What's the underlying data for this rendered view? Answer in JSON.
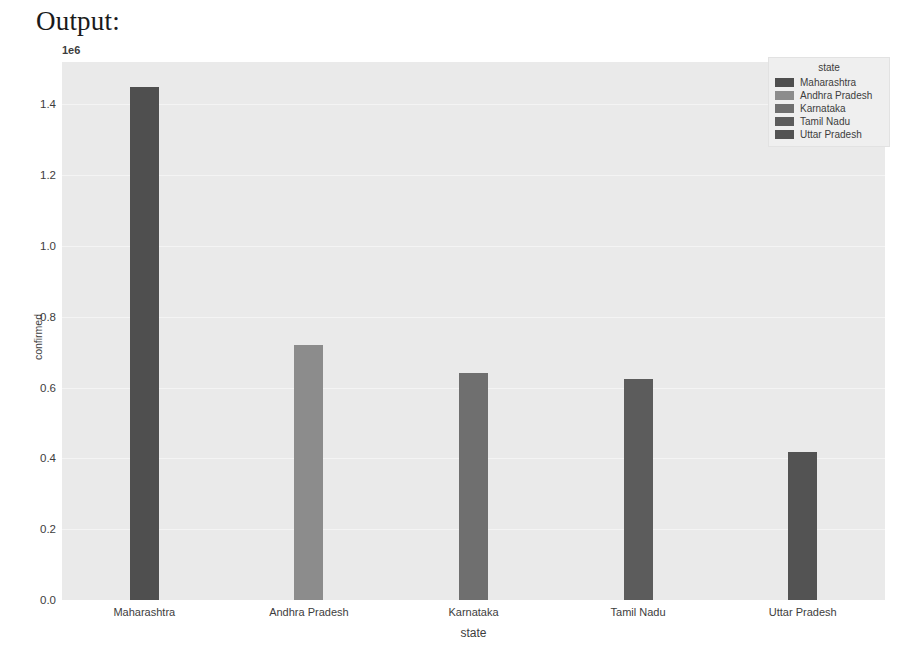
{
  "output_label": "Output:",
  "chart_data": {
    "type": "bar",
    "title": "",
    "xlabel": "state",
    "ylabel": "confirmed",
    "y_offset_text": "1e6",
    "y_offset_multiplier": 1000000,
    "categories": [
      "Maharashtra",
      "Andhra Pradesh",
      "Karnataka",
      "Tamil Nadu",
      "Uttar Pradesh"
    ],
    "values": [
      1450000,
      720000,
      640000,
      625000,
      418000
    ],
    "values_scaled": [
      1.45,
      0.72,
      0.64,
      0.625,
      0.418
    ],
    "bar_colors": [
      "#4f4f4f",
      "#8c8c8c",
      "#6f6f6f",
      "#5c5c5c",
      "#535353"
    ],
    "ylim": [
      0,
      1.52
    ],
    "yticks": [
      0.0,
      0.2,
      0.4,
      0.6,
      0.8,
      1.0,
      1.2,
      1.4
    ],
    "ytick_labels": [
      "0.0",
      "0.2",
      "0.4",
      "0.6",
      "0.8",
      "1.0",
      "1.2",
      "1.4"
    ],
    "grid": true,
    "grid_color": "#f4f4f4",
    "plot_background": "#eaeaea",
    "figure_background": "#ffffff",
    "legend": {
      "title": "state",
      "position": "upper right",
      "entries": [
        {
          "label": "Maharashtra",
          "color": "#4f4f4f"
        },
        {
          "label": "Andhra Pradesh",
          "color": "#8c8c8c"
        },
        {
          "label": "Karnataka",
          "color": "#6f6f6f"
        },
        {
          "label": "Tamil Nadu",
          "color": "#5c5c5c"
        },
        {
          "label": "Uttar Pradesh",
          "color": "#535353"
        }
      ]
    }
  }
}
